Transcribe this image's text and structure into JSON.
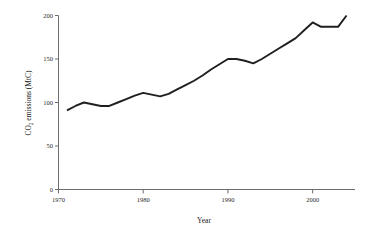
{
  "chart_data": {
    "type": "line",
    "title": "",
    "xlabel": "Year",
    "ylabel": "CO2 emissions (MtC)",
    "ylabel_main": "CO",
    "ylabel_sub": "2",
    "ylabel_rest": " emissions (MtC)",
    "xlim": [
      1970,
      2005
    ],
    "ylim": [
      0,
      200
    ],
    "xticks": [
      1970,
      1980,
      1990,
      2000
    ],
    "xtick_labels": [
      "1970",
      "1980",
      "1990",
      "2000"
    ],
    "yticks": [
      0,
      50,
      100,
      150,
      200
    ],
    "ytick_labels": [
      "0",
      "50",
      "100",
      "150",
      "200"
    ],
    "grid": false,
    "legend": "none",
    "line_color": "#1f1f1f",
    "axis_color": "#6d6d6d",
    "x": [
      1971,
      1972,
      1973,
      1974,
      1975,
      1976,
      1977,
      1978,
      1979,
      1980,
      1981,
      1982,
      1983,
      1984,
      1985,
      1986,
      1987,
      1988,
      1989,
      1990,
      1991,
      1992,
      1993,
      1994,
      1995,
      1996,
      1997,
      1998,
      1999,
      2000,
      2001,
      2002,
      2003,
      2004
    ],
    "values": [
      91,
      96,
      100,
      98,
      96,
      96,
      100,
      104,
      108,
      111,
      109,
      107,
      110,
      115,
      120,
      125,
      131,
      138,
      144,
      150,
      150,
      148,
      145,
      150,
      156,
      162,
      168,
      174,
      183,
      192,
      187,
      187,
      187,
      200
    ],
    "series": [
      {
        "name": "CO2 emissions (MtC)",
        "values": [
          91,
          96,
          100,
          98,
          96,
          96,
          100,
          104,
          108,
          111,
          109,
          107,
          110,
          115,
          120,
          125,
          131,
          138,
          144,
          150,
          150,
          148,
          145,
          150,
          156,
          162,
          168,
          174,
          183,
          192,
          187,
          187,
          187,
          200
        ]
      }
    ]
  }
}
